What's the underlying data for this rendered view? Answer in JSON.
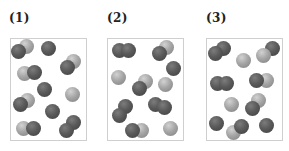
{
  "figure": {
    "panels": [
      {
        "label": "(1)",
        "label_x": 9,
        "box": {
          "x": 10,
          "w": 77
        },
        "particles": [
          {
            "x": 26,
            "y": 46,
            "type": "light"
          },
          {
            "x": 18,
            "y": 51,
            "type": "dark"
          },
          {
            "x": 48,
            "y": 48,
            "type": "dark"
          },
          {
            "x": 73,
            "y": 61,
            "type": "light"
          },
          {
            "x": 67,
            "y": 67,
            "type": "dark"
          },
          {
            "x": 24,
            "y": 73,
            "type": "light"
          },
          {
            "x": 34,
            "y": 72,
            "type": "dark"
          },
          {
            "x": 44,
            "y": 89,
            "type": "dark"
          },
          {
            "x": 72,
            "y": 94,
            "type": "light"
          },
          {
            "x": 27,
            "y": 100,
            "type": "light"
          },
          {
            "x": 20,
            "y": 104,
            "type": "dark"
          },
          {
            "x": 52,
            "y": 111,
            "type": "dark"
          },
          {
            "x": 23,
            "y": 128,
            "type": "light"
          },
          {
            "x": 33,
            "y": 128,
            "type": "dark"
          },
          {
            "x": 73,
            "y": 122,
            "type": "dark"
          },
          {
            "x": 66,
            "y": 130,
            "type": "dark"
          }
        ]
      },
      {
        "label": "(2)",
        "label_x": 107,
        "box": {
          "x": 107,
          "w": 77
        },
        "particles": [
          {
            "x": 119,
            "y": 50,
            "type": "dark"
          },
          {
            "x": 128,
            "y": 50,
            "type": "dark"
          },
          {
            "x": 166,
            "y": 47,
            "type": "light"
          },
          {
            "x": 159,
            "y": 53,
            "type": "dark"
          },
          {
            "x": 173,
            "y": 68,
            "type": "dark"
          },
          {
            "x": 118,
            "y": 77,
            "type": "light"
          },
          {
            "x": 145,
            "y": 81,
            "type": "light"
          },
          {
            "x": 139,
            "y": 88,
            "type": "dark"
          },
          {
            "x": 165,
            "y": 84,
            "type": "light"
          },
          {
            "x": 125,
            "y": 106,
            "type": "dark"
          },
          {
            "x": 119,
            "y": 115,
            "type": "dark"
          },
          {
            "x": 155,
            "y": 104,
            "type": "dark"
          },
          {
            "x": 164,
            "y": 107,
            "type": "dark"
          },
          {
            "x": 141,
            "y": 130,
            "type": "light"
          },
          {
            "x": 132,
            "y": 130,
            "type": "dark"
          },
          {
            "x": 170,
            "y": 128,
            "type": "light"
          }
        ]
      },
      {
        "label": "(3)",
        "label_x": 206,
        "box": {
          "x": 206,
          "w": 77
        },
        "particles": [
          {
            "x": 223,
            "y": 48,
            "type": "dark"
          },
          {
            "x": 215,
            "y": 53,
            "type": "dark"
          },
          {
            "x": 243,
            "y": 60,
            "type": "light"
          },
          {
            "x": 272,
            "y": 48,
            "type": "dark"
          },
          {
            "x": 263,
            "y": 55,
            "type": "light"
          },
          {
            "x": 217,
            "y": 83,
            "type": "dark"
          },
          {
            "x": 226,
            "y": 83,
            "type": "dark"
          },
          {
            "x": 266,
            "y": 80,
            "type": "light"
          },
          {
            "x": 256,
            "y": 80,
            "type": "dark"
          },
          {
            "x": 231,
            "y": 104,
            "type": "light"
          },
          {
            "x": 258,
            "y": 100,
            "type": "light"
          },
          {
            "x": 252,
            "y": 108,
            "type": "dark"
          },
          {
            "x": 216,
            "y": 123,
            "type": "dark"
          },
          {
            "x": 233,
            "y": 132,
            "type": "light"
          },
          {
            "x": 241,
            "y": 126,
            "type": "dark"
          },
          {
            "x": 266,
            "y": 125,
            "type": "dark"
          }
        ]
      }
    ],
    "legend_colors": {
      "dark_particle": "#555555",
      "light_particle": "#a0a0a0",
      "box_border": "#cfcfcf"
    }
  }
}
